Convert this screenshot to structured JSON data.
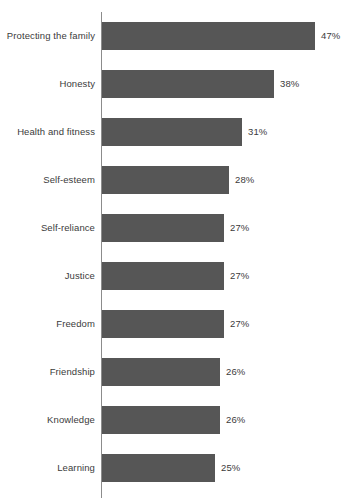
{
  "chart_data": {
    "type": "bar",
    "orientation": "horizontal",
    "title": "",
    "subtitle": "",
    "xlabel": "",
    "ylabel": "",
    "grid": false,
    "legend": false,
    "axis_line": "vertical-left",
    "xlim": [
      0,
      47
    ],
    "value_suffix": "%",
    "bar_color": "#565656",
    "text_color": "#3b3b3b",
    "axis_color": "#8c8c8c",
    "background_color": "#ffffff",
    "categories": [
      "Protecting the family",
      "Honesty",
      "Health and fitness",
      "Self-esteem",
      "Self-reliance",
      "Justice",
      "Freedom",
      "Friendship",
      "Knowledge",
      "Learning"
    ],
    "values": [
      47,
      38,
      31,
      28,
      27,
      27,
      27,
      26,
      26,
      25
    ],
    "value_labels": [
      "47%",
      "38%",
      "31%",
      "28%",
      "27%",
      "27%",
      "27%",
      "26%",
      "26%",
      "25%"
    ]
  },
  "rows": [
    {
      "label": "Protecting the family",
      "value": 47,
      "value_label": "47%"
    },
    {
      "label": "Honesty",
      "value": 38,
      "value_label": "38%"
    },
    {
      "label": "Health and fitness",
      "value": 31,
      "value_label": "31%"
    },
    {
      "label": "Self-esteem",
      "value": 28,
      "value_label": "28%"
    },
    {
      "label": "Self-reliance",
      "value": 27,
      "value_label": "27%"
    },
    {
      "label": "Justice",
      "value": 27,
      "value_label": "27%"
    },
    {
      "label": "Freedom",
      "value": 27,
      "value_label": "27%"
    },
    {
      "label": "Friendship",
      "value": 26,
      "value_label": "26%"
    },
    {
      "label": "Knowledge",
      "value": 26,
      "value_label": "26%"
    },
    {
      "label": "Learning",
      "value": 25,
      "value_label": "25%"
    }
  ],
  "layout": {
    "first_bar_top": 22,
    "row_pitch": 48,
    "bar_height": 28,
    "px_per_unit": 4.53,
    "value_gap": 6
  }
}
